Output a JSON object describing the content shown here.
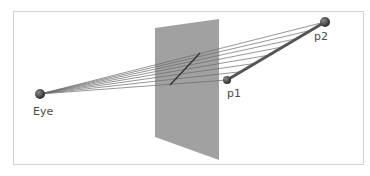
{
  "diagram": {
    "colors": {
      "background": "#ffffff",
      "frame": "#d2d2d2",
      "plane": "#999999",
      "ray": "#6a6a6a",
      "segment": "#555555",
      "projection": "#3a3a3a",
      "point": "#4d4d4d"
    },
    "nodes": [
      {
        "id": "eye",
        "label": "Eye",
        "x": 40,
        "y": 94,
        "r": 5
      },
      {
        "id": "p1",
        "label": "p1",
        "x": 227,
        "y": 80,
        "r": 4
      },
      {
        "id": "p2",
        "label": "p2",
        "x": 325,
        "y": 22,
        "r": 5
      }
    ],
    "image_plane": {
      "points": [
        [
          155,
          28
        ],
        [
          219,
          19
        ],
        [
          219,
          160
        ],
        [
          155,
          137
        ]
      ]
    },
    "projected_segment": {
      "from": [
        170,
        85
      ],
      "to": [
        200,
        53
      ]
    },
    "ray_count": 8
  }
}
